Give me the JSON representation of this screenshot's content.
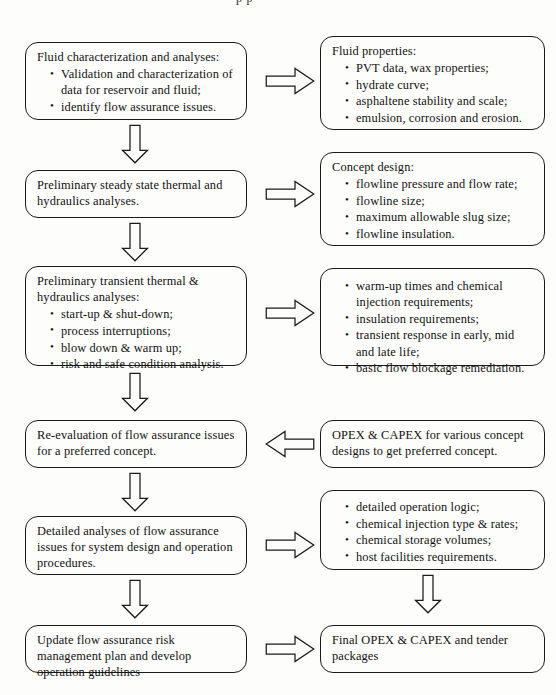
{
  "diagram": {
    "clipped_top_text": "p      p",
    "rows": [
      {
        "id": "row-1",
        "left": {
          "header": "Fluid characterization and analyses:",
          "bullets": [
            "Validation and characterization of data for reservoir and fluid;",
            "identify flow assurance issues."
          ]
        },
        "arrow": "arrow-right",
        "right": {
          "header": "Fluid properties:",
          "bullets": [
            "PVT data, wax properties;",
            "hydrate curve;",
            "asphaltene stability and scale;",
            "emulsion, corrosion and erosion."
          ]
        }
      },
      {
        "id": "row-2",
        "left": {
          "header": "",
          "text": "Preliminary steady state thermal and hydraulics analyses.",
          "bullets": []
        },
        "arrow": "arrow-right",
        "right": {
          "header": "Concept design:",
          "bullets": [
            "flowline pressure and flow rate;",
            "flowline size;",
            "maximum allowable slug size;",
            "flowline insulation."
          ]
        }
      },
      {
        "id": "row-3",
        "left": {
          "header": "Preliminary transient thermal & hydraulics analyses:",
          "bullets": [
            "start-up & shut-down;",
            "process interruptions;",
            "blow down & warm up;",
            "risk and safe condition analysis."
          ]
        },
        "arrow": "arrow-right",
        "right": {
          "header": "",
          "bullets": [
            "warm-up times and chemical injection requirements;",
            "insulation requirements;",
            "transient response in early, mid and late life;",
            "basic flow blockage remediation."
          ]
        }
      },
      {
        "id": "row-4",
        "left": {
          "header": "",
          "text": "Re-evaluation of flow assurance issues for a preferred concept.",
          "bullets": []
        },
        "arrow": "arrow-left",
        "right": {
          "header": "",
          "text": "OPEX & CAPEX for various concept designs to get preferred concept.",
          "bullets": []
        }
      },
      {
        "id": "row-5",
        "left": {
          "header": "",
          "text": "Detailed analyses of flow assurance issues for system design and operation procedures.",
          "bullets": []
        },
        "arrow": "arrow-right",
        "right": {
          "header": "",
          "bullets": [
            "detailed operation logic;",
            "chemical injection type & rates;",
            "chemical storage volumes;",
            "host facilities requirements."
          ]
        }
      },
      {
        "id": "row-6",
        "left": {
          "header": "",
          "text": "Update flow assurance risk management plan and develop operation guidelines",
          "bullets": []
        },
        "arrow": "arrow-right",
        "right": {
          "header": "",
          "text": "Final OPEX & CAPEX and tender packages",
          "bullets": []
        }
      }
    ],
    "connectors": {
      "left_down_arrows": 5,
      "right_down_arrows": 1,
      "arrow_style": "hollow-block-outline",
      "stroke_color": "#1a1a1a",
      "fill_color": "#fdfdfc"
    }
  }
}
